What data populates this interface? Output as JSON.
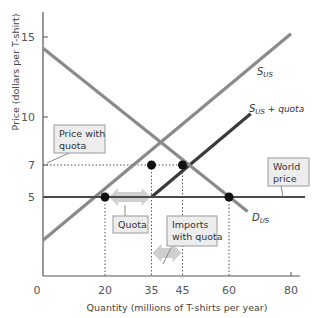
{
  "chart_data": {
    "type": "line",
    "title": "",
    "xlabel": "Quantity (millions of T-shirts per year)",
    "ylabel": "Price (dollars per T-shirt)",
    "xlim": [
      0,
      85
    ],
    "ylim": [
      0,
      16.5
    ],
    "x_ticks": [
      0,
      20,
      35,
      45,
      60,
      80
    ],
    "y_ticks": [
      5,
      7,
      10,
      15
    ],
    "grid": false,
    "series": [
      {
        "name": "S_US",
        "label_main": "S",
        "label_sub": "US",
        "label_rest": "",
        "points": [
          [
            0,
            2.3
          ],
          [
            80,
            15.2
          ]
        ],
        "color": "#8a8a8a"
      },
      {
        "name": "S_US + quota",
        "label_main": "S",
        "label_sub": "US",
        "label_rest": " + quota",
        "points": [
          [
            35,
            5
          ],
          [
            67,
            10.2
          ]
        ],
        "color": "#3a3a3a"
      },
      {
        "name": "D_US",
        "label_main": "D",
        "label_sub": "US",
        "label_rest": "",
        "points": [
          [
            0,
            14.3
          ],
          [
            66,
            4.1
          ]
        ],
        "color": "#8a8a8a"
      },
      {
        "name": "World price",
        "points": [
          [
            0,
            5
          ],
          [
            85,
            5
          ]
        ],
        "color": "#4a4a4a"
      }
    ],
    "points_of_interest": [
      {
        "name": "domestic-supply-at-world-price",
        "x": 20,
        "y": 5
      },
      {
        "name": "demand-at-world-price",
        "x": 60,
        "y": 5
      },
      {
        "name": "domestic-supply-at-quota-price",
        "x": 35,
        "y": 7
      },
      {
        "name": "equilibrium-with-quota",
        "x": 45,
        "y": 7
      }
    ],
    "annotations": [
      {
        "text_lines": [
          "Price with",
          "quota"
        ],
        "points_to": [
          0,
          7
        ]
      },
      {
        "text_lines": [
          "World",
          "price"
        ],
        "points_to": [
          80,
          5
        ]
      },
      {
        "text_lines": [
          "Quota"
        ],
        "arrow_between": [
          20,
          35
        ],
        "at_y": 5
      },
      {
        "text_lines": [
          "Imports",
          "with quota"
        ],
        "arrow_between": [
          35,
          45
        ],
        "at_y": 1.5
      }
    ],
    "colors": {
      "supply": "#8a8a8a",
      "supply_quota": "#3a3a3a",
      "demand": "#8a8a8a",
      "world_price": "#4a4a4a",
      "axis": "#555555",
      "arrow": "#cfcfcf",
      "note_box_fill": "#ededed",
      "note_box_stroke": "#9a9a9a",
      "dot": "#111111"
    }
  }
}
